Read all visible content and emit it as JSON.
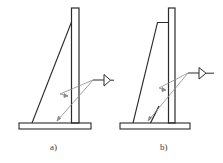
{
  "figure": {
    "type": "technical weld drawing",
    "colors": {
      "stroke": "#2b2b2b",
      "leader": "#8a8a8a",
      "background": "#ffffff"
    },
    "panels": [
      {
        "id": "a",
        "label": "a)",
        "components": [
          "vertical-plate",
          "triangular-gusset",
          "base-plate",
          "fillet-weld-symbol"
        ],
        "weld_symbol": "fillet-triangle"
      },
      {
        "id": "b",
        "label": "b)",
        "components": [
          "vertical-plate",
          "trapezoidal-gusset",
          "corner-brace",
          "base-plate",
          "fillet-weld-symbol"
        ],
        "weld_symbol": "fillet-triangle"
      }
    ]
  }
}
